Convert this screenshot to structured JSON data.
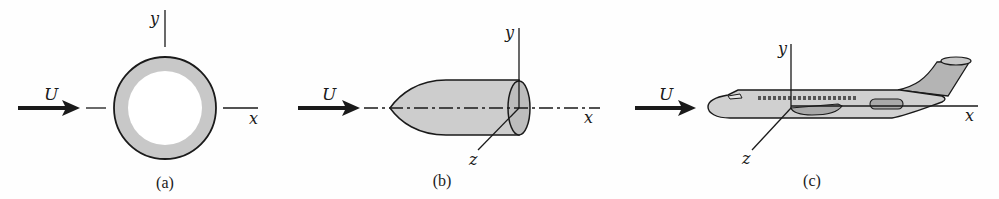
{
  "figure": {
    "panels": [
      {
        "id": "a",
        "caption": "(a)",
        "object": "circular cylinder cross-section (ring)",
        "flow_label": "U",
        "axes": {
          "x": "x",
          "y": "y"
        }
      },
      {
        "id": "b",
        "caption": "(b)",
        "object": "ellipsoidal-nosed cylindrical body",
        "flow_label": "U",
        "axes": {
          "x": "x",
          "y": "y",
          "z": "z"
        }
      },
      {
        "id": "c",
        "caption": "(c)",
        "object": "airplane",
        "flow_label": "U",
        "axes": {
          "x": "x",
          "y": "y",
          "z": "z"
        }
      }
    ],
    "colors": {
      "ink": "#1a1a1a",
      "body_fill": "#c8c8c8",
      "body_fill_light": "#d6d6d6",
      "tail_fill": "#b4b4b4",
      "background": "#fefefe"
    }
  }
}
